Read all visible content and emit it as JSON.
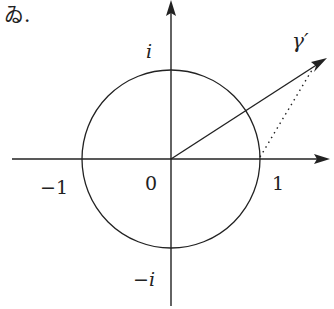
{
  "header_fragment": "ゐ.",
  "diagram": {
    "axes": {
      "x_label_neg": "−1",
      "origin": "0",
      "x_label_pos": "1",
      "y_label_pos": "i",
      "y_label_neg": "−i"
    },
    "vector_label": "γ′",
    "colors": {
      "stroke": "#222222",
      "background": "#ffffff"
    }
  }
}
